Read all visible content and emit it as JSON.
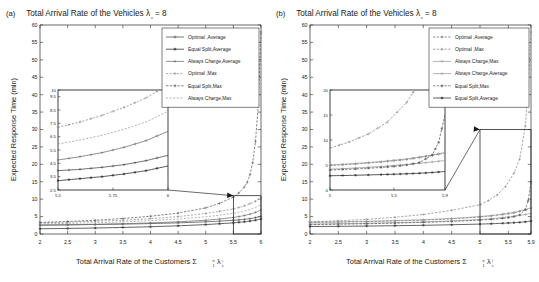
{
  "figure": {
    "panels": [
      {
        "panel_label": "(a)",
        "chart_data": {
          "type": "line",
          "title": "Total Arrival Rate of the Vehicles λ",
          "title_sub": "v",
          "title_tail": " = 8",
          "xlabel": "Total Arrival Rate of the Customers Σ",
          "xlabel_sup": "n",
          "xlabel_sub": "1",
          "xlabel_lam": "λ",
          "xlabel_lam_sup": "i",
          "xlabel_lam_sub": "c",
          "ylabel": "Expected Response Time (min)",
          "xlim": [
            2,
            6
          ],
          "ylim": [
            0,
            60
          ],
          "xticks": [
            "2",
            "2.5",
            "3",
            "3.5",
            "4",
            "4.5",
            "5",
            "5.5",
            "6"
          ],
          "xtick_vals": [
            2,
            2.5,
            3,
            3.5,
            4,
            4.5,
            5,
            5.5,
            6
          ],
          "yticks": [
            "0",
            "5",
            "10",
            "15",
            "20",
            "25",
            "30",
            "35",
            "40",
            "45",
            "50",
            "55",
            "60"
          ],
          "ytick_vals": [
            0,
            5,
            10,
            15,
            20,
            25,
            30,
            35,
            40,
            45,
            50,
            55,
            60
          ],
          "grid": false,
          "legend_position": "top-right",
          "legend": [
            {
              "label": "Optimal ,Average",
              "color": "#4a4a4a",
              "dash": "none",
              "marker": "plus"
            },
            {
              "label": "Equal Split,Average",
              "color": "#2b2b2b",
              "dash": "none",
              "marker": "star"
            },
            {
              "label": "Always Charge,Average",
              "color": "#6e6e6e",
              "dash": "none",
              "marker": "plus"
            },
            {
              "label": "Optimal ,Max",
              "color": "#8a8a8a",
              "dash": "2,1.6",
              "marker": "plus"
            },
            {
              "label": "Equal Split,Max",
              "color": "#5a5a5a",
              "dash": "2.4,1.4",
              "marker": "plus"
            },
            {
              "label": "Always Charge,Max",
              "color": "#9a9a9a",
              "dash": "2,1.6",
              "marker": "none"
            }
          ],
          "series": [
            {
              "name": "Optimal ,Average",
              "x": [
                2,
                2.5,
                3,
                3.5,
                4,
                4.5,
                5,
                5.25,
                5.5,
                5.6,
                5.7,
                5.8,
                5.9,
                6
              ],
              "y": [
                2.55,
                2.62,
                2.72,
                2.84,
                2.99,
                3.2,
                3.5,
                3.7,
                3.95,
                4.05,
                4.2,
                4.4,
                4.7,
                5.1
              ]
            },
            {
              "name": "Equal Split,Average",
              "x": [
                2,
                2.5,
                3,
                3.5,
                4,
                4.5,
                5,
                5.25,
                5.5,
                5.6,
                5.7,
                5.8,
                5.9,
                6
              ],
              "y": [
                1.5,
                1.6,
                1.72,
                1.88,
                2.08,
                2.35,
                2.7,
                2.95,
                3.2,
                3.35,
                3.5,
                3.7,
                3.95,
                4.3
              ]
            },
            {
              "name": "Always Charge,Average",
              "x": [
                2,
                2.5,
                3,
                3.5,
                4,
                4.5,
                5,
                5.25,
                5.5,
                5.6,
                5.7,
                5.8,
                5.9,
                6
              ],
              "y": [
                2.55,
                2.65,
                2.78,
                2.95,
                3.18,
                3.5,
                3.95,
                4.3,
                4.75,
                5.0,
                5.3,
                5.7,
                6.2,
                6.9
              ]
            },
            {
              "name": "Optimal ,Max",
              "x": [
                2,
                2.5,
                3,
                3.5,
                4,
                4.5,
                5,
                5.25,
                5.5,
                5.6,
                5.7,
                5.8,
                5.9,
                6
              ],
              "y": [
                3.2,
                3.4,
                3.65,
                3.95,
                4.4,
                5.0,
                5.9,
                6.5,
                7.2,
                7.6,
                8.1,
                8.7,
                9.4,
                10.4
              ]
            },
            {
              "name": "Equal Split,Max",
              "x": [
                2,
                2.5,
                3,
                3.5,
                4,
                4.5,
                5,
                5.25,
                5.5,
                5.6,
                5.7,
                5.75,
                5.8,
                5.85,
                5.9,
                5.95,
                6
              ],
              "y": [
                3.3,
                3.6,
                3.95,
                4.45,
                5.1,
                6.0,
                7.5,
                8.8,
                10.6,
                11.8,
                13.5,
                14.8,
                17.0,
                20.5,
                26.5,
                37,
                58
              ]
            },
            {
              "name": "Always Charge,Max",
              "x": [
                2,
                2.5,
                3,
                3.5,
                4,
                4.5,
                5,
                5.25,
                5.5,
                5.6,
                5.7,
                5.8,
                5.9,
                6
              ],
              "y": [
                2.9,
                3.05,
                3.25,
                3.5,
                3.85,
                4.3,
                4.95,
                5.4,
                5.95,
                6.25,
                6.6,
                7.05,
                7.6,
                8.4
              ]
            }
          ],
          "inset": {
            "xlim": [
              5.5,
              6
            ],
            "ylim": [
              2.5,
              10
            ],
            "xticks": [
              "5.5",
              "5.75",
              "6"
            ],
            "xtick_vals": [
              5.5,
              5.75,
              6
            ],
            "yticks": [
              "2.5",
              "3.5",
              "4.5",
              "5.5",
              "6.5",
              "7.5",
              "8.5",
              "9.5",
              "10"
            ],
            "ytick_vals": [
              2.5,
              3.5,
              4.5,
              5.5,
              6.5,
              7.5,
              8.5,
              9.5,
              10
            ]
          },
          "zoom_box": {
            "x0": 5.5,
            "x1": 6.0,
            "y0": 0,
            "y1": 11
          }
        }
      },
      {
        "panel_label": "(b)",
        "chart_data": {
          "type": "line",
          "title": "Total Arrival Rate of the Vehicles λ",
          "title_sub": "v",
          "title_tail": " = 8",
          "xlabel": "Total Arrival Rate of the Customers Σ",
          "xlabel_sup": "n",
          "xlabel_sub": "1",
          "xlabel_lam": "λ",
          "xlabel_lam_sup": "i",
          "xlabel_lam_sub": "c",
          "ylabel": "Expected Response Time (min)",
          "xlim": [
            2,
            5.9
          ],
          "ylim": [
            0,
            60
          ],
          "xticks": [
            "2",
            "2.5",
            "3",
            "3.5",
            "4",
            "4.5",
            "5",
            "5.5",
            "5.9"
          ],
          "xtick_vals": [
            2,
            2.5,
            3,
            3.5,
            4,
            4.5,
            5,
            5.5,
            5.9
          ],
          "yticks": [
            "0",
            "5",
            "10",
            "15",
            "20",
            "25",
            "30",
            "35",
            "40",
            "45",
            "50",
            "55",
            "60"
          ],
          "ytick_vals": [
            0,
            5,
            10,
            15,
            20,
            25,
            30,
            35,
            40,
            45,
            50,
            55,
            60
          ],
          "grid": false,
          "legend_position": "top-right",
          "legend": [
            {
              "label": "Optimal ,Average",
              "color": "#6e6e6e",
              "dash": "2.4,1.4",
              "marker": "plus"
            },
            {
              "label": "Optimal ,Max",
              "color": "#8a8a8a",
              "dash": "2.4,1.4",
              "marker": "plus"
            },
            {
              "label": "Always Charge,Max",
              "color": "#9a9a9a",
              "dash": "none",
              "marker": "plus"
            },
            {
              "label": "Always Charge,Average",
              "color": "#9a9a9a",
              "dash": "none",
              "marker": "plus"
            },
            {
              "label": "Equal Split,Max",
              "color": "#5a5a5a",
              "dash": "2.4,1.4",
              "marker": "star"
            },
            {
              "label": "Equal Split,Average",
              "color": "#2b2b2b",
              "dash": "none",
              "marker": "star"
            }
          ],
          "series": [
            {
              "name": "Optimal ,Average",
              "x": [
                2,
                2.5,
                3,
                3.5,
                4,
                4.5,
                5,
                5.2,
                5.4,
                5.5,
                5.6,
                5.7,
                5.8,
                5.9
              ],
              "y": [
                3.3,
                3.4,
                3.55,
                3.75,
                4.0,
                4.35,
                4.9,
                5.2,
                5.6,
                5.85,
                6.1,
                6.5,
                6.9,
                7.4
              ]
            },
            {
              "name": "Optimal ,Max",
              "x": [
                2,
                2.5,
                3,
                3.5,
                4,
                4.5,
                5,
                5.15,
                5.3,
                5.45,
                5.6,
                5.7,
                5.8,
                5.85,
                5.9
              ],
              "y": [
                3.5,
                3.8,
                4.2,
                4.8,
                5.6,
                6.8,
                8.4,
                9.6,
                11.2,
                13.6,
                17.5,
                21.5,
                31,
                42,
                58
              ]
            },
            {
              "name": "Always Charge,Max",
              "x": [
                2,
                2.5,
                3,
                3.5,
                4,
                4.5,
                5,
                5.2,
                5.4,
                5.5,
                5.6,
                5.7,
                5.8,
                5.9
              ],
              "y": [
                3.4,
                3.5,
                3.65,
                3.85,
                4.1,
                4.45,
                5.0,
                5.3,
                5.7,
                5.95,
                6.2,
                6.6,
                7.0,
                7.5
              ]
            },
            {
              "name": "Always Charge,Average",
              "x": [
                2,
                2.5,
                3,
                3.5,
                4,
                4.5,
                5,
                5.2,
                5.4,
                5.5,
                5.6,
                5.7,
                5.8,
                5.9
              ],
              "y": [
                2.85,
                2.95,
                3.08,
                3.25,
                3.45,
                3.75,
                4.15,
                4.4,
                4.7,
                4.9,
                5.1,
                5.35,
                5.6,
                5.9
              ]
            },
            {
              "name": "Equal Split,Max",
              "x": [
                2,
                2.5,
                3,
                3.5,
                4,
                4.5,
                5,
                5.2,
                5.4,
                5.5,
                5.6,
                5.7,
                5.8,
                5.85,
                5.9
              ],
              "y": [
                2.7,
                2.8,
                2.95,
                3.12,
                3.35,
                3.6,
                4.0,
                4.2,
                4.5,
                4.7,
                5.0,
                5.5,
                7.0,
                9.5,
                15.0
              ]
            },
            {
              "name": "Equal Split,Average",
              "x": [
                2,
                2.5,
                3,
                3.5,
                4,
                4.5,
                5,
                5.2,
                5.4,
                5.5,
                5.6,
                5.7,
                5.8,
                5.9
              ],
              "y": [
                2.15,
                2.2,
                2.28,
                2.38,
                2.5,
                2.65,
                2.85,
                2.95,
                3.08,
                3.15,
                3.25,
                3.35,
                3.5,
                3.7
              ]
            }
          ],
          "inset": {
            "xlim": [
              5.0,
              5.9
            ],
            "ylim": [
              0,
              20
            ],
            "xticks": [
              "5",
              "5.5",
              "5.9"
            ],
            "xtick_vals": [
              5.0,
              5.5,
              5.9
            ],
            "yticks": [
              "0",
              "5",
              "10",
              "15",
              "20"
            ],
            "ytick_vals": [
              0,
              5,
              10,
              15,
              20
            ]
          },
          "zoom_box": {
            "x0": 5.0,
            "x1": 5.9,
            "y0": 0,
            "y1": 30
          }
        }
      }
    ]
  }
}
